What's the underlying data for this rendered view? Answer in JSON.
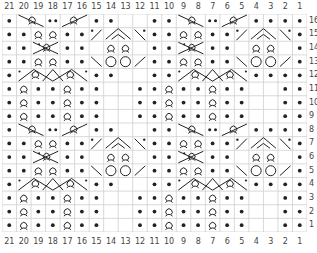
{
  "chart": {
    "type": "knitting-chart",
    "columns": [
      "21",
      "20",
      "19",
      "18",
      "17",
      "16",
      "15",
      "14",
      "13",
      "12",
      "11",
      "10",
      "9",
      "8",
      "7",
      "6",
      "5",
      "4",
      "3",
      "2",
      "1"
    ],
    "rows": [
      "16",
      "15",
      "14",
      "13",
      "12",
      "11",
      "10",
      "9",
      "8",
      "7",
      "6",
      "5",
      "4",
      "3",
      "2",
      "1"
    ],
    "colors": {
      "grid": "#cfcfcf",
      "symbol": "#222222",
      "label": "#444444",
      "background": "#ffffff"
    },
    "legend_symbols": {
      "p": "purl (dot)",
      "k": "knit (blank)",
      "t": "twisted stitch (loop)",
      "o": "yarn over (circle)",
      "cl": "left-leaning decrease line",
      "cr": "right-leaning decrease line",
      "pt": "single purl dot in cable"
    },
    "cells": [
      [
        "p",
        "XL",
        "XL",
        "pp",
        "XR",
        "XR",
        "p",
        "p",
        "k",
        "k",
        "p",
        "p",
        "XL",
        "XL",
        "pp",
        "XR",
        "XR",
        "p",
        "p",
        "p",
        "p"
      ],
      [
        "p",
        "p",
        "t",
        "t",
        "p",
        "p",
        "DL",
        "AP",
        "AP",
        "DR",
        "p",
        "p",
        "t",
        "t",
        "p",
        "p",
        "DL",
        "AP",
        "AP",
        "DR",
        "p"
      ],
      [
        "p",
        "p",
        "XC",
        "XC",
        "p",
        "p",
        "k",
        "t",
        "t",
        "k",
        "p",
        "p",
        "XC",
        "XC",
        "p",
        "p",
        "k",
        "t",
        "t",
        "k",
        "p"
      ],
      [
        "p",
        "p",
        "t",
        "t",
        "p",
        "p",
        "BL",
        "o",
        "o",
        "BR",
        "p",
        "p",
        "t",
        "t",
        "p",
        "p",
        "BL",
        "o",
        "o",
        "BR",
        "p"
      ],
      [
        "p",
        "YL",
        "YL",
        "YM",
        "YR",
        "YR",
        "p",
        "p",
        "k",
        "k",
        "p",
        "p",
        "YL",
        "YL",
        "YM",
        "YR",
        "YR",
        "p",
        "p",
        "p",
        "p"
      ],
      [
        "p",
        "t",
        "p",
        "p",
        "t",
        "p",
        "p",
        "k",
        "k",
        "p",
        "p",
        "t",
        "p",
        "p",
        "t",
        "p",
        "p",
        "k",
        "k",
        "p",
        "p"
      ],
      [
        "p",
        "t",
        "p",
        "p",
        "t",
        "p",
        "p",
        "k",
        "k",
        "p",
        "p",
        "t",
        "p",
        "p",
        "t",
        "p",
        "p",
        "k",
        "k",
        "p",
        "p"
      ],
      [
        "p",
        "t",
        "p",
        "p",
        "t",
        "p",
        "p",
        "k",
        "k",
        "p",
        "p",
        "t",
        "p",
        "p",
        "t",
        "p",
        "p",
        "k",
        "k",
        "p",
        "p"
      ],
      [
        "p",
        "XL",
        "XL",
        "pp",
        "XR",
        "XR",
        "p",
        "p",
        "k",
        "k",
        "p",
        "p",
        "XL",
        "XL",
        "pp",
        "XR",
        "XR",
        "p",
        "p",
        "p",
        "p"
      ],
      [
        "p",
        "p",
        "t",
        "t",
        "p",
        "p",
        "DL",
        "AP",
        "AP",
        "DR",
        "p",
        "p",
        "t",
        "t",
        "p",
        "p",
        "DL",
        "AP",
        "AP",
        "DR",
        "p"
      ],
      [
        "p",
        "p",
        "XC",
        "XC",
        "p",
        "p",
        "k",
        "t",
        "t",
        "k",
        "p",
        "p",
        "XC",
        "XC",
        "p",
        "p",
        "k",
        "t",
        "t",
        "k",
        "p"
      ],
      [
        "p",
        "p",
        "t",
        "t",
        "p",
        "p",
        "BL",
        "o",
        "o",
        "BR",
        "p",
        "p",
        "t",
        "t",
        "p",
        "p",
        "BL",
        "o",
        "o",
        "BR",
        "p"
      ],
      [
        "p",
        "YL",
        "YL",
        "YM",
        "YR",
        "YR",
        "p",
        "p",
        "k",
        "k",
        "p",
        "p",
        "YL",
        "YL",
        "YM",
        "YR",
        "YR",
        "p",
        "p",
        "p",
        "p"
      ],
      [
        "p",
        "t",
        "p",
        "p",
        "t",
        "p",
        "p",
        "k",
        "k",
        "p",
        "p",
        "t",
        "p",
        "p",
        "t",
        "p",
        "p",
        "k",
        "k",
        "p",
        "p"
      ],
      [
        "p",
        "t",
        "p",
        "p",
        "t",
        "p",
        "p",
        "k",
        "k",
        "p",
        "p",
        "t",
        "p",
        "p",
        "t",
        "p",
        "p",
        "k",
        "k",
        "p",
        "p"
      ],
      [
        "p",
        "t",
        "p",
        "p",
        "t",
        "p",
        "p",
        "k",
        "k",
        "p",
        "p",
        "t",
        "p",
        "p",
        "t",
        "p",
        "p",
        "k",
        "k",
        "p",
        "p"
      ]
    ]
  }
}
